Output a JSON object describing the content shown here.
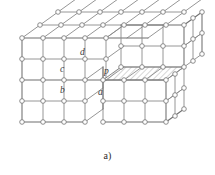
{
  "figure": {
    "caption": "a)",
    "type": "diagram",
    "colors": {
      "edge": "#8a8a8a",
      "edge_strong": "#6f6f6f",
      "node_fill": "#ffffff",
      "node_stroke": "#7a7a7a",
      "hatch_stroke": "#7a7a7a",
      "hatch_fill": "#ffffff",
      "label": "#3a3a3a",
      "background": "#ffffff"
    },
    "lattice": {
      "front_cols": 4,
      "front_rows": 4,
      "side_depth": 3,
      "top_depth": 3,
      "cell_w": 21,
      "cell_h": 21,
      "depth_dx": 18,
      "depth_dy": -13,
      "origin_x": 22,
      "origin_y": 38
    },
    "labels": [
      {
        "id": "label-d",
        "text": "d",
        "x": 80,
        "y": 55
      },
      {
        "id": "label-c",
        "text": "c",
        "x": 60,
        "y": 72
      },
      {
        "id": "label-p",
        "text": "p",
        "x": 104,
        "y": 74
      },
      {
        "id": "label-b",
        "text": "b",
        "x": 60,
        "y": 93
      },
      {
        "id": "label-a",
        "text": "a",
        "x": 98,
        "y": 95
      }
    ],
    "hatched_region": {
      "name": "terrace-face",
      "fill_pattern": "diagonal-hatch",
      "cells": 3
    }
  }
}
